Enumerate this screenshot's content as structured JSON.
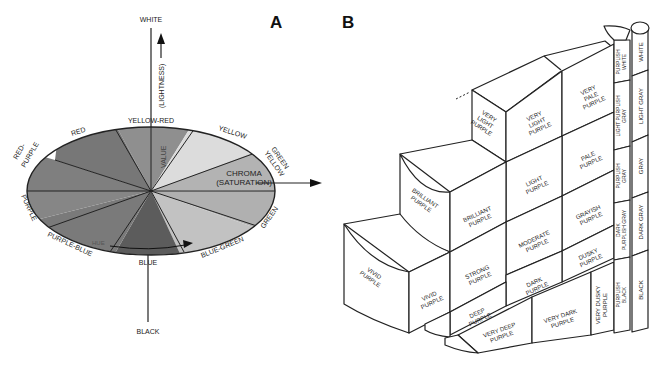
{
  "panels": {
    "a": {
      "letter": "A",
      "axis": {
        "top": "WHITE",
        "bottom": "BLACK",
        "vertical_label": "(LIGHTNESS)",
        "value_label": "VALUE",
        "chroma_label": "CHROMA",
        "chroma_sub": "(SATURATION)",
        "hue_label": "HUE"
      },
      "hues": [
        "YELLOW-RED",
        "YELLOW",
        "GREEN YELLOW",
        "GREEN",
        "BLUE-GREEN",
        "BLUE",
        "PURPLE-BLUE",
        "PURPLE",
        "RED-PURPLE",
        "RED"
      ],
      "hue_labels": {
        "yellow_red": "YELLOW-RED",
        "yellow": "YELLOW",
        "green_1": "GREEN",
        "yellow_2": "YELLOW",
        "green": "GREEN",
        "blue_green": "BLUE-GREEN",
        "blue": "BLUE",
        "purple_blue": "PURPLE-BLUE",
        "purple": "PURPLE",
        "red_1": "RED-",
        "purple_2": "PURPLE",
        "red": "RED"
      },
      "colors": {
        "yellow_red": "#8f8f8f",
        "yellow": "#dcdcdc",
        "green_yellow": "#b3b3b3",
        "green": "#b0b0b0",
        "blue_green": "#c2c2c2",
        "blue": "#5c5c5c",
        "purple_blue": "#7a7a7a",
        "purple": "#868686",
        "red_purple": "#7f7f7f",
        "red": "#777777"
      }
    },
    "b": {
      "letter": "B",
      "cells": {
        "very_light_purple_side": [
          "VERY",
          "LIGHT",
          "PURPLE"
        ],
        "very_light_purple": [
          "VERY",
          "LIGHT",
          "PURPLE"
        ],
        "very_pale_purple": [
          "VERY",
          "PALE",
          "PURPLE"
        ],
        "pale_purple": [
          "PALE",
          "PURPLE"
        ],
        "light_purple": [
          "LIGHT",
          "PURPLE"
        ],
        "brilliant_purple_side": [
          "BRILLIANT",
          "PURPLE"
        ],
        "brilliant_purple": [
          "BRILLIANT",
          "PURPLE"
        ],
        "grayish_purple": [
          "GRAYISH",
          "PURPLE"
        ],
        "moderate_purple": [
          "MODERATE",
          "PURPLE"
        ],
        "strong_purple": [
          "STRONG",
          "PURPLE"
        ],
        "dusky_purple": [
          "DUSKY",
          "PURPLE"
        ],
        "vivid_purple_side": [
          "VIVID",
          "PURPLE"
        ],
        "vivid_purple": [
          "VIVID",
          "PURPLE"
        ],
        "dark_purple": [
          "DARK",
          "PURPLE"
        ],
        "deep_purple": [
          "DEEP",
          "PURPLE"
        ],
        "very_deep_purple": [
          "VERY DEEP",
          "PURPLE"
        ],
        "very_dark_purple": [
          "VERY DARK",
          "PURPLE"
        ],
        "very_dusky_purple": [
          "VERY DUSKY",
          "PURPLE"
        ]
      },
      "purplish_column": [
        "PURPLISH WHITE",
        "LIGHT PURPLISH GRAY",
        "PURPLISH GRAY",
        "DARK PURPLISH GRAY",
        "PURPLISH BLACK"
      ],
      "purplish_lines": {
        "white": [
          "PURPLISH",
          "WHITE"
        ],
        "light_gray": [
          "LIGHT PURPLISH",
          "GRAY"
        ],
        "gray": [
          "PURPLISH",
          "GRAY"
        ],
        "dark_gray": [
          "DARK",
          "PURPLISH GRAY"
        ],
        "black": [
          "PURPLISH",
          "BLACK"
        ]
      },
      "gray_column": [
        "WHITE",
        "LIGHT GRAY",
        "GRAY",
        "DARK GRAY",
        "BLACK"
      ]
    }
  }
}
